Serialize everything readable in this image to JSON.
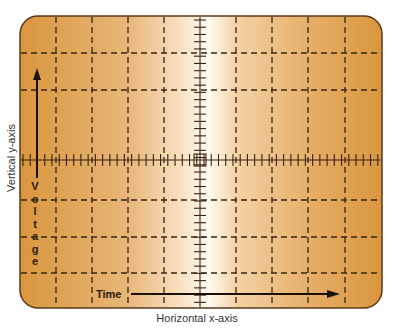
{
  "diagram": {
    "type": "oscilloscope-graticule",
    "vertical_axis_label": "Vertical y-axis",
    "horizontal_axis_label": "Horizontal x-axis",
    "x_quantity": "Time",
    "y_quantity": "Voltage",
    "y_quantity_letters": [
      "V",
      "o",
      "l",
      "t",
      "a",
      "g",
      "e"
    ],
    "grid": {
      "vertical_divisions": 10,
      "horizontal_lines_y": [
        53,
        90,
        200,
        237,
        273
      ],
      "center_line_y": 160,
      "vertical_lines_x": [
        56,
        92,
        128,
        164,
        236,
        272,
        308,
        345
      ],
      "center_line_x": 200,
      "minor_ticks_per_division": 5,
      "center_marker": "small-square"
    },
    "colors": {
      "screen_edge": "#d9963e",
      "screen_center": "#fffaf2",
      "grid_line": "#3a2510",
      "frame_border": "#5a3a1c"
    }
  }
}
